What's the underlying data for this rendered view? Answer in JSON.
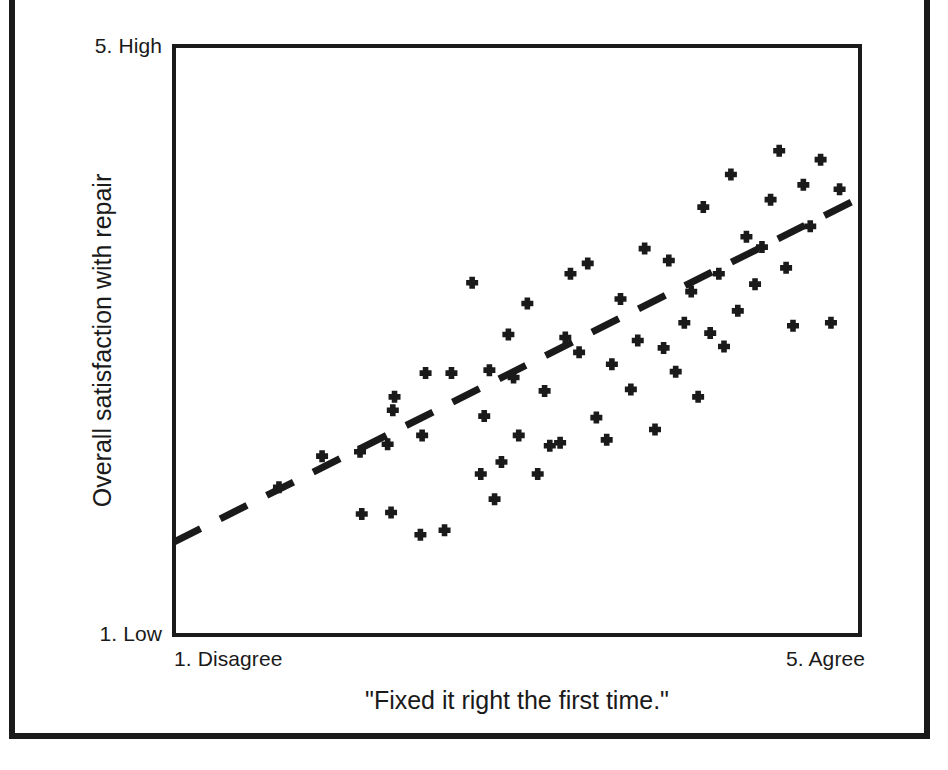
{
  "figure": {
    "frame_color": "#1a1a1a",
    "background": "#ffffff"
  },
  "axes": {
    "y_high_label": "5. High",
    "y_low_label": "1. Low",
    "x_low_label": "1. Disagree",
    "x_high_label": "5. Agree",
    "y_title": "Overall satisfaction with repair",
    "x_title": "\"Fixed it right the first time.\""
  },
  "chart_data": {
    "type": "scatter",
    "title": "",
    "xlabel": "\"Fixed it right the first time.\"",
    "ylabel": "Overall satisfaction with repair",
    "xlim": [
      1,
      5
    ],
    "ylim": [
      1,
      5
    ],
    "xtick_labels": [
      "1. Disagree",
      "5. Agree"
    ],
    "ytick_labels": [
      "1. Low",
      "5. High"
    ],
    "grid": false,
    "legend": false,
    "marker": "plus",
    "marker_color": "#1a1a1a",
    "series": [
      {
        "name": "Customer responses",
        "points": [
          [
            1.62,
            2.01
          ],
          [
            1.87,
            2.22
          ],
          [
            2.09,
            2.25
          ],
          [
            2.1,
            1.83
          ],
          [
            2.27,
            1.84
          ],
          [
            2.25,
            2.3
          ],
          [
            2.28,
            2.53
          ],
          [
            2.29,
            2.62
          ],
          [
            2.44,
            1.69
          ],
          [
            2.45,
            2.36
          ],
          [
            2.47,
            2.78
          ],
          [
            2.58,
            1.72
          ],
          [
            2.62,
            2.78
          ],
          [
            2.74,
            3.39
          ],
          [
            2.79,
            2.1
          ],
          [
            2.81,
            2.49
          ],
          [
            2.84,
            2.8
          ],
          [
            2.87,
            1.93
          ],
          [
            2.91,
            2.18
          ],
          [
            2.95,
            3.04
          ],
          [
            2.98,
            2.75
          ],
          [
            3.01,
            2.36
          ],
          [
            3.06,
            3.25
          ],
          [
            3.12,
            2.1
          ],
          [
            3.16,
            2.66
          ],
          [
            3.19,
            2.29
          ],
          [
            3.25,
            2.31
          ],
          [
            3.28,
            3.02
          ],
          [
            3.31,
            3.45
          ],
          [
            3.36,
            2.92
          ],
          [
            3.41,
            3.52
          ],
          [
            3.46,
            2.48
          ],
          [
            3.52,
            2.33
          ],
          [
            3.55,
            2.84
          ],
          [
            3.6,
            3.28
          ],
          [
            3.66,
            2.67
          ],
          [
            3.7,
            3.0
          ],
          [
            3.74,
            3.62
          ],
          [
            3.8,
            2.4
          ],
          [
            3.85,
            2.95
          ],
          [
            3.88,
            3.54
          ],
          [
            3.92,
            2.79
          ],
          [
            3.97,
            3.12
          ],
          [
            4.01,
            3.33
          ],
          [
            4.05,
            2.62
          ],
          [
            4.08,
            3.9
          ],
          [
            4.12,
            3.05
          ],
          [
            4.17,
            3.45
          ],
          [
            4.2,
            2.96
          ],
          [
            4.24,
            4.12
          ],
          [
            4.28,
            3.2
          ],
          [
            4.33,
            3.7
          ],
          [
            4.38,
            3.38
          ],
          [
            4.42,
            3.63
          ],
          [
            4.47,
            3.95
          ],
          [
            4.52,
            4.28
          ],
          [
            4.56,
            3.49
          ],
          [
            4.6,
            3.1
          ],
          [
            4.66,
            4.05
          ],
          [
            4.7,
            3.77
          ],
          [
            4.76,
            4.22
          ],
          [
            4.82,
            3.12
          ],
          [
            4.87,
            4.02
          ]
        ]
      }
    ],
    "trend_line": {
      "style": "dashed",
      "color": "#1a1a1a",
      "start": [
        1.01,
        1.64
      ],
      "end": [
        5.0,
        3.97
      ]
    }
  }
}
